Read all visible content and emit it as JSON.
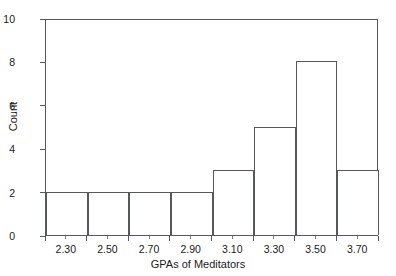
{
  "chart_data": {
    "type": "bar",
    "title": "",
    "subtitle": "",
    "xlabel": "GPAs of Meditators",
    "ylabel": "Count",
    "categories": [
      "2.30",
      "2.50",
      "2.70",
      "2.90",
      "3.10",
      "3.30",
      "3.50",
      "3.70"
    ],
    "values": [
      2,
      2,
      2,
      2,
      3,
      5,
      8,
      3
    ],
    "bin_edges": [
      2.2,
      2.4,
      2.6,
      2.8,
      3.0,
      3.2,
      3.4,
      3.6,
      3.8
    ],
    "bin_width": 0.2,
    "xlim": [
      2.2,
      3.8
    ],
    "ylim": [
      0,
      10
    ],
    "y_ticks": [
      0,
      2,
      4,
      6,
      8,
      10
    ],
    "y_tick_labels": [
      "0",
      "2",
      "4",
      "6",
      "8",
      "10"
    ],
    "x_tick_labels": [
      "2.30",
      "2.50",
      "2.70",
      "2.90",
      "3.10",
      "3.30",
      "3.50",
      "3.70"
    ],
    "grid": false,
    "legend": false,
    "legend_position": "none",
    "bar_fill": "#ffffff",
    "bar_edge_color": "#55595c",
    "axis_color": "#55595c",
    "background": "#ffffff",
    "annotations": []
  },
  "figure": {
    "y_axis_title": "Count",
    "x_axis_title": "GPAs of Meditators"
  }
}
